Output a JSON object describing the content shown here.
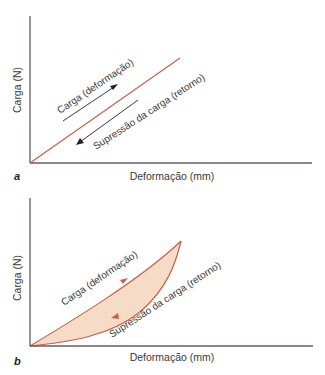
{
  "colors": {
    "axis": "#6b5a5e",
    "curve": "#c9604a",
    "fill": "#f6dcc6",
    "arrow": "#222222",
    "text": "#3a3a3a"
  },
  "panels": [
    {
      "id": "a",
      "panel_label": "a",
      "y_axis_label": "Carga (N)",
      "x_axis_label": "Deformação (mm)",
      "loading_label": "Carga (deformação)",
      "unloading_label": "Supressão da carga (retorno)"
    },
    {
      "id": "b",
      "panel_label": "b",
      "y_axis_label": "Carga (N)",
      "x_axis_label": "Deformação (mm)",
      "loading_label": "Carga (deformação)",
      "unloading_label": "Supressão da carga (retorno)"
    }
  ]
}
